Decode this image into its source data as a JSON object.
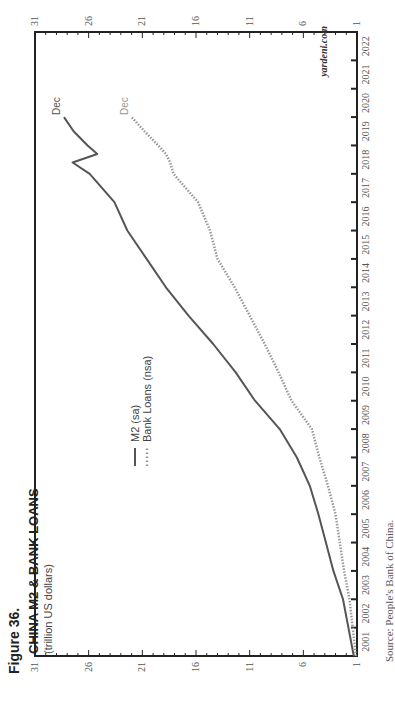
{
  "figure_label": "Figure 36.",
  "title": "CHINA M2 & BANK LOANS",
  "subtitle": "(trillion US dollars)",
  "watermark": "yardeni.com",
  "source": "Source: People's Bank of China.",
  "colors": {
    "m2": "#555555",
    "loans": "#999999",
    "axis": "#222222"
  },
  "legend": [
    {
      "label": "M2 (sa)",
      "style": "solid"
    },
    {
      "label": "Bank Loans (nsa)",
      "style": "dotted"
    }
  ],
  "end_labels": {
    "m2": "Dec",
    "loans": "Dec"
  },
  "chart_data": {
    "type": "line",
    "title": "CHINA M2 & BANK LOANS",
    "subtitle": "(trillion US dollars)",
    "xlabel": "",
    "ylabel": "trillion US dollars",
    "ylim": [
      1,
      31
    ],
    "y_ticks": [
      1,
      6,
      11,
      16,
      21,
      26,
      31
    ],
    "y_axis_both_sides": true,
    "x_tick_labels": [
      "2001",
      "2002",
      "2003",
      "2004",
      "2005",
      "2006",
      "2007",
      "2008",
      "2009",
      "2010",
      "2011",
      "2012",
      "2013",
      "2014",
      "2015",
      "2016",
      "2017",
      "2018",
      "2019",
      "2020",
      "2021",
      "2022"
    ],
    "xlim": [
      2001,
      2023
    ],
    "grid": false,
    "legend_position": "upper-left inside",
    "x": [
      2001.0,
      2002.0,
      2003.0,
      2004.0,
      2005.0,
      2006.0,
      2007.0,
      2008.0,
      2009.0,
      2010.0,
      2011.0,
      2012.0,
      2013.0,
      2014.0,
      2015.0,
      2016.0,
      2017.0,
      2018.0,
      2018.4,
      2018.7,
      2019.0,
      2019.5,
      2020.0
    ],
    "series": [
      {
        "name": "M2 (sa)",
        "style": "solid",
        "values": [
          1.3,
          1.8,
          2.3,
          3.2,
          3.9,
          4.6,
          5.4,
          6.6,
          8.2,
          10.5,
          12.3,
          14.4,
          16.7,
          18.8,
          20.6,
          22.4,
          23.6,
          25.9,
          27.5,
          25.2,
          26.1,
          27.4,
          28.3
        ]
      },
      {
        "name": "Bank Loans (nsa)",
        "style": "dotted",
        "values": [
          1.1,
          1.4,
          1.7,
          2.2,
          2.6,
          3.0,
          3.7,
          4.5,
          5.2,
          7.1,
          8.3,
          9.6,
          11.0,
          12.4,
          14.0,
          14.7,
          15.8,
          18.1,
          18.4,
          18.8,
          19.5,
          20.8,
          22.0
        ]
      }
    ],
    "annotations": [
      "Dec",
      "Dec",
      "yardeni.com"
    ]
  }
}
